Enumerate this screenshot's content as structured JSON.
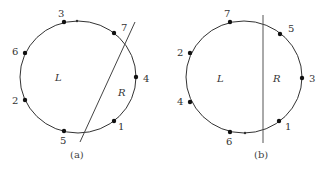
{
  "figure": {
    "panels": [
      {
        "caption": "(a)",
        "region_left": "L",
        "region_right": "R",
        "points": [
          {
            "label": "3",
            "x": 64,
            "y": 22,
            "lx": 58,
            "ly": 17
          },
          {
            "label": "7",
            "x": 114,
            "y": 33,
            "lx": 121,
            "ly": 31
          },
          {
            "label": "6",
            "x": 25,
            "y": 53,
            "lx": 12,
            "ly": 55
          },
          {
            "label": "4",
            "x": 136,
            "y": 77,
            "lx": 143,
            "ly": 82
          },
          {
            "label": "2",
            "x": 25,
            "y": 100,
            "lx": 12,
            "ly": 104
          },
          {
            "label": "1",
            "x": 114,
            "y": 121,
            "lx": 118,
            "ly": 130
          },
          {
            "label": "5",
            "x": 64,
            "y": 131,
            "lx": 60,
            "ly": 144
          }
        ],
        "arrow_mark": {
          "x": 77,
          "y": 21
        },
        "line": {
          "x1": 135,
          "y1": 22,
          "x2": 80,
          "y2": 142
        }
      },
      {
        "caption": "(b)",
        "region_left": "L",
        "region_right": "R",
        "points": [
          {
            "label": "7",
            "x": 230,
            "y": 22,
            "lx": 224,
            "ly": 17
          },
          {
            "label": "5",
            "x": 280,
            "y": 34,
            "lx": 288,
            "ly": 32
          },
          {
            "label": "2",
            "x": 190,
            "y": 53,
            "lx": 177,
            "ly": 56
          },
          {
            "label": "3",
            "x": 302,
            "y": 78,
            "lx": 309,
            "ly": 82
          },
          {
            "label": "4",
            "x": 190,
            "y": 102,
            "lx": 177,
            "ly": 105
          },
          {
            "label": "1",
            "x": 279,
            "y": 121,
            "lx": 285,
            "ly": 130
          },
          {
            "label": "6",
            "x": 230,
            "y": 132,
            "lx": 226,
            "ly": 145
          }
        ],
        "arrow_mark": {
          "x": 245,
          "y": 133
        },
        "line": {
          "x1": 263,
          "y1": 15,
          "x2": 263,
          "y2": 143
        }
      }
    ]
  }
}
